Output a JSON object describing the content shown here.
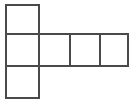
{
  "figure": {
    "name": "square-net",
    "background_color": "#ffffff",
    "line_color": "#4a4a4a",
    "line_width": 2,
    "canvas": {
      "width": 136,
      "height": 103
    },
    "grid": {
      "x_lines": [
        6,
        39,
        70,
        100,
        128
      ],
      "y_lines": [
        5,
        34,
        66,
        98
      ],
      "columns": 4,
      "rows": 3
    },
    "cell_count": 5,
    "cells": [
      {
        "id": "cell-top-left",
        "label": "",
        "col": 0,
        "row": 0,
        "x": 6,
        "y": 5,
        "width": 33,
        "height": 29
      },
      {
        "id": "cell-middle-col0",
        "label": "",
        "col": 0,
        "row": 1,
        "x": 6,
        "y": 34,
        "width": 33,
        "height": 32
      },
      {
        "id": "cell-middle-col1",
        "label": "",
        "col": 1,
        "row": 1,
        "x": 39,
        "y": 34,
        "width": 31,
        "height": 32
      },
      {
        "id": "cell-middle-col2",
        "label": "",
        "col": 2,
        "row": 1,
        "x": 70,
        "y": 34,
        "width": 30,
        "height": 32
      },
      {
        "id": "cell-middle-col3",
        "label": "",
        "col": 3,
        "row": 1,
        "x": 100,
        "y": 34,
        "width": 28,
        "height": 32
      },
      {
        "id": "cell-bottom-left",
        "label": "",
        "col": 0,
        "row": 2,
        "x": 6,
        "y": 66,
        "width": 33,
        "height": 32
      }
    ],
    "edges": [
      {
        "id": "edge-top",
        "x1": 6,
        "y1": 5,
        "x2": 39,
        "y2": 5
      },
      {
        "id": "edge-top-left-vert",
        "x1": 6,
        "y1": 5,
        "x2": 6,
        "y2": 98
      },
      {
        "id": "edge-col0-right-upper",
        "x1": 39,
        "y1": 5,
        "x2": 39,
        "y2": 34
      },
      {
        "id": "edge-row1-top",
        "x1": 6,
        "y1": 34,
        "x2": 128,
        "y2": 34
      },
      {
        "id": "edge-row1-bottom",
        "x1": 6,
        "y1": 66,
        "x2": 128,
        "y2": 66
      },
      {
        "id": "edge-divider-col1",
        "x1": 39,
        "y1": 34,
        "x2": 39,
        "y2": 66
      },
      {
        "id": "edge-divider-col2",
        "x1": 70,
        "y1": 34,
        "x2": 70,
        "y2": 66
      },
      {
        "id": "edge-divider-col3",
        "x1": 100,
        "y1": 34,
        "x2": 100,
        "y2": 66
      },
      {
        "id": "edge-right",
        "x1": 128,
        "y1": 34,
        "x2": 128,
        "y2": 66
      },
      {
        "id": "edge-col0-right-lower",
        "x1": 39,
        "y1": 66,
        "x2": 39,
        "y2": 98
      },
      {
        "id": "edge-bottom",
        "x1": 6,
        "y1": 98,
        "x2": 39,
        "y2": 98
      }
    ]
  }
}
